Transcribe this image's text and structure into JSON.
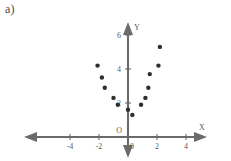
{
  "part_label": "a)",
  "chart_data": {
    "type": "scatter",
    "title": "",
    "xlabel": "X",
    "ylabel": "Y",
    "xlim": [
      -5.2,
      4.6
    ],
    "ylim": [
      -1.4,
      6.4
    ],
    "grid": false,
    "legend": null,
    "xticks": [
      -4,
      -2,
      0,
      2,
      4
    ],
    "xtick_labels": [
      "-4",
      "-2",
      "0",
      "2",
      "4"
    ],
    "yticks": [
      0,
      2,
      4,
      6
    ],
    "ytick_labels": [
      "0",
      "2",
      "4",
      "6"
    ],
    "origin_label": "O",
    "series": [
      {
        "name": "data",
        "marker": "filled-circle",
        "color": "#2e2e2e",
        "points": [
          {
            "x": -2.1,
            "y": 4.2
          },
          {
            "x": -1.8,
            "y": 3.5
          },
          {
            "x": -1.6,
            "y": 2.9
          },
          {
            "x": -1.0,
            "y": 2.3
          },
          {
            "x": -0.7,
            "y": 1.9
          },
          {
            "x": 0.0,
            "y": 1.6
          },
          {
            "x": 0.3,
            "y": 1.3
          },
          {
            "x": 0.9,
            "y": 1.9
          },
          {
            "x": 1.2,
            "y": 2.3
          },
          {
            "x": 1.4,
            "y": 2.9
          },
          {
            "x": 1.5,
            "y": 3.7
          },
          {
            "x": 2.1,
            "y": 4.2
          },
          {
            "x": 2.2,
            "y": 5.3
          }
        ]
      }
    ]
  }
}
